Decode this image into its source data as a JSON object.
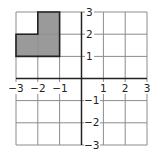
{
  "diagram": {
    "type": "coordinate-grid",
    "x_range": [
      -3,
      3
    ],
    "y_range": [
      -3,
      3
    ],
    "grid_step": 1,
    "x_tick_labels": [
      "−3",
      "−2",
      "−1",
      "1",
      "2",
      "3"
    ],
    "y_tick_labels": [
      "3",
      "2",
      "1",
      "−1",
      "−2",
      "−3"
    ],
    "shaded_cells": [
      {
        "x0": -2,
        "y0": 2,
        "x1": -1,
        "y1": 3
      },
      {
        "x0": -3,
        "y0": 1,
        "x1": -2,
        "y1": 2
      },
      {
        "x0": -2,
        "y0": 1,
        "x1": -1,
        "y1": 2
      }
    ],
    "shaded_shape_description": "L-shaped region of 3 unit squares in quadrant II",
    "colors": {
      "shade": "#9a9a9a",
      "grid": "#8c8c8c",
      "axis": "#222222",
      "outline": "#222222"
    }
  }
}
